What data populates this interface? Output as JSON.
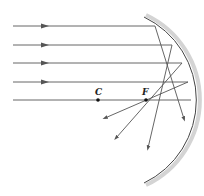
{
  "diagram": {
    "labels": {
      "center": "C",
      "focus": "F"
    },
    "colors": {
      "ray": "#555555",
      "mirror": "#444444",
      "mirror_shade": "#cfcfcf",
      "point": "#111111"
    },
    "points": {
      "C": {
        "x": 98,
        "y": 100
      },
      "F": {
        "x": 146,
        "y": 100
      }
    },
    "incident_rays": [
      {
        "y": 26,
        "x_start": 13,
        "x_end": 155
      },
      {
        "y": 45,
        "x_start": 13,
        "x_end": 172
      },
      {
        "y": 63,
        "x_start": 13,
        "x_end": 182
      },
      {
        "y": 82,
        "x_start": 13,
        "x_end": 188
      },
      {
        "y": 100,
        "x_start": 13,
        "x_end": 191
      }
    ],
    "reflected_rays": [
      {
        "from": [
          155,
          26
        ],
        "to": [
          184,
          119
        ]
      },
      {
        "from": [
          172,
          45
        ],
        "to": [
          148,
          148
        ]
      },
      {
        "from": [
          182,
          63
        ],
        "to": [
          116,
          138
        ]
      },
      {
        "from": [
          188,
          82
        ],
        "to": [
          105,
          118
        ]
      }
    ]
  }
}
